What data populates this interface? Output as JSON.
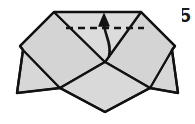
{
  "figure": {
    "type": "origami-instruction",
    "step_label": "5",
    "background_color": "#ffffff",
    "paper_fill_color": "#d7d7d7",
    "paper_fill_shadow_color": "#c9c9c9",
    "outline_color": "#111111",
    "fold_line_color": "#141414",
    "arrow_color": "#141414",
    "outline_width_px": 2.2,
    "fold_line_style": "dashed",
    "arrow_style": "curved-valley-fold-arrow",
    "arrow_direction": "upward"
  },
  "shapes": {
    "outer_body": {
      "name": "folded-paper-outline",
      "points": "54,12 141,12 175,46 172,50 178,93 150,88 105,112 60,88 17,93 23,50 20,46"
    },
    "left_upper_flap": {
      "name": "left-upper-flap-panel",
      "points": "54,12 105,62 60,88 23,50 20,46"
    },
    "right_upper_flap": {
      "name": "right-upper-flap-panel",
      "points": "141,12 175,46 172,50 150,88 105,62"
    },
    "left_lower_point": {
      "name": "left-lower-point-panel",
      "points": "23,50 60,88 17,93"
    },
    "right_lower_point": {
      "name": "right-lower-point-panel",
      "points": "172,50 178,93 150,88"
    },
    "center_v_flap": {
      "name": "center-v-flap-panel",
      "points": "54,12 141,12 105,62"
    },
    "bottom_wedge": {
      "name": "bottom-point-panel",
      "points": "60,88 105,62 150,88 105,112"
    },
    "fold_line": {
      "name": "dashed-fold-line",
      "x1": 66,
      "y1": 28,
      "x2": 144,
      "y2": 28,
      "dash": "7 5"
    },
    "arrow": {
      "name": "curved-fold-arrow",
      "path": "M 109,56 C 112,44 105,36 104,24",
      "head": "104,14 99,26 109,26"
    }
  }
}
